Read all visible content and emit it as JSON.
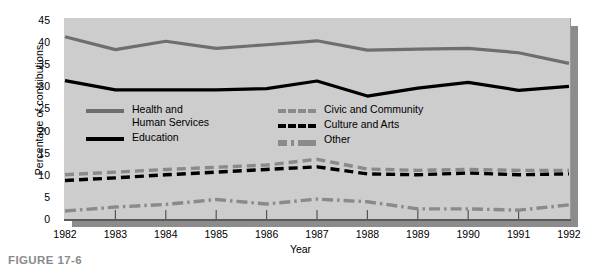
{
  "figure": {
    "caption": "FIGURE 17-6"
  },
  "chart_data": {
    "type": "line",
    "title": "",
    "xlabel": "Year",
    "ylabel": "Percentage of contributions",
    "categories": [
      "1982",
      "1983",
      "1984",
      "1985",
      "1986",
      "1987",
      "1988",
      "1989",
      "1990",
      "1991",
      "1992"
    ],
    "x": [
      1982,
      1983,
      1984,
      1985,
      1986,
      1987,
      1988,
      1989,
      1990,
      1991,
      1992
    ],
    "xlim": [
      1982,
      1992
    ],
    "ylim": [
      0,
      45
    ],
    "yticks": [
      0,
      5,
      10,
      15,
      20,
      25,
      30,
      35,
      40,
      45
    ],
    "grid": false,
    "legend_position": "inside-upper-left",
    "series": [
      {
        "name": "Health and\nHuman Services",
        "legend_label": "Health and\nHuman Services",
        "color": "#6e6e6e",
        "style": "solid",
        "values": [
          41.2,
          38.3,
          40.2,
          38.6,
          39.4,
          40.3,
          38.2,
          38.4,
          38.6,
          37.6,
          35.2
        ]
      },
      {
        "name": "Education",
        "legend_label": "Education",
        "color": "#000000",
        "style": "solid",
        "values": [
          31.3,
          29.2,
          29.2,
          29.2,
          29.5,
          31.2,
          27.8,
          29.6,
          30.9,
          29.1,
          30.0
        ]
      },
      {
        "name": "Civic and Community",
        "legend_label": "Civic and Community",
        "color": "#8a8a8a",
        "style": "dashed",
        "values": [
          10.0,
          10.6,
          11.2,
          11.7,
          12.2,
          13.5,
          11.3,
          11.0,
          11.2,
          11.0,
          11.0
        ]
      },
      {
        "name": "Culture and Arts",
        "legend_label": "Culture and Arts",
        "color": "#000000",
        "style": "dashed",
        "values": [
          8.7,
          9.3,
          10.0,
          10.6,
          11.2,
          11.8,
          10.2,
          10.0,
          10.4,
          10.0,
          10.2
        ]
      },
      {
        "name": "Other",
        "legend_label": "Other",
        "color": "#8a8a8a",
        "style": "dashdot",
        "values": [
          1.8,
          2.7,
          3.3,
          4.4,
          3.4,
          4.5,
          3.9,
          2.3,
          2.3,
          2.0,
          3.2
        ]
      }
    ]
  },
  "legend": {
    "left_entries": [
      {
        "label": "Health and\nHuman Services",
        "swatch": "solid-gray"
      },
      {
        "label": "Education",
        "swatch": "solid-black"
      }
    ],
    "right_entries": [
      {
        "label": "Civic and Community",
        "swatch": "dash-gray"
      },
      {
        "label": "Culture and Arts",
        "swatch": "dash-black"
      },
      {
        "label": "Other",
        "swatch": "dashdot-gray"
      }
    ]
  },
  "colors": {
    "panel_background": "#cdcdcd",
    "shadow": "#8c8c8c",
    "page_background": "#ffffff",
    "caption": "#8b8b8b"
  }
}
